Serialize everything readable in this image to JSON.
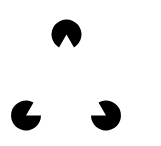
{
  "figure": {
    "background": "#ffffff",
    "fill": "#000000",
    "radius": 15,
    "inducers": [
      {
        "name": "top",
        "cx": 66.5,
        "cy": 34.5,
        "notch_start_deg": 60,
        "notch_end_deg": 120
      },
      {
        "name": "bottom-left",
        "cx": 26,
        "cy": 115.5,
        "notch_start_deg": 300,
        "notch_end_deg": 360
      },
      {
        "name": "bottom-right",
        "cx": 106,
        "cy": 115.5,
        "notch_start_deg": 180,
        "notch_end_deg": 240
      }
    ]
  }
}
